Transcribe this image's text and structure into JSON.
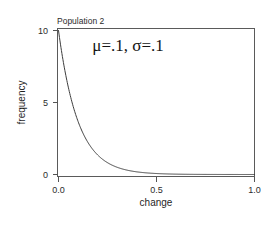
{
  "figure": {
    "panel_title": "Population 2",
    "annotation": "μ=.1, σ=.1",
    "background_color": "#ffffff",
    "line_color": "#3d3d3d",
    "axis_color": "#555555"
  },
  "chart_data": {
    "type": "line",
    "title": "Population 2",
    "xlabel": "change",
    "ylabel": "frequency",
    "xlim": [
      0.0,
      1.0
    ],
    "ylim": [
      0.0,
      10.4
    ],
    "grid": false,
    "legend": null,
    "annotations": [
      {
        "text": "μ=.1, σ=.1",
        "x": 0.36,
        "y": 9.0
      }
    ],
    "xticks": [
      0.0,
      0.5,
      1.0
    ],
    "xtick_labels": [
      "0.0",
      "0.5",
      "1.0"
    ],
    "yticks": [
      0,
      5,
      10
    ],
    "ytick_labels": [
      "0",
      "5",
      "10"
    ],
    "series": [
      {
        "name": "exponential density (rate=10)",
        "x": [
          0.0,
          0.01,
          0.02,
          0.03,
          0.04,
          0.05,
          0.06,
          0.07,
          0.08,
          0.09,
          0.1,
          0.12,
          0.14,
          0.16,
          0.18,
          0.2,
          0.22,
          0.24,
          0.26,
          0.28,
          0.3,
          0.33,
          0.36,
          0.4,
          0.45,
          0.5,
          0.55,
          0.6,
          0.65,
          0.7,
          0.75,
          0.8,
          0.85,
          0.9,
          0.95,
          1.0
        ],
        "y": [
          10.0,
          9.05,
          8.19,
          7.41,
          6.7,
          6.07,
          5.49,
          4.97,
          4.49,
          4.07,
          3.68,
          3.01,
          2.47,
          2.02,
          1.65,
          1.35,
          1.11,
          0.91,
          0.74,
          0.61,
          0.5,
          0.37,
          0.27,
          0.18,
          0.11,
          0.067,
          0.041,
          0.025,
          0.015,
          0.009,
          0.006,
          0.003,
          0.002,
          0.001,
          0.001,
          0.0005
        ]
      }
    ]
  }
}
